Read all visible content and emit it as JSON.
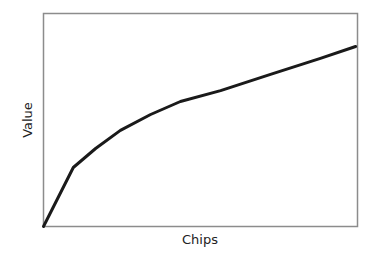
{
  "chart_data": {
    "type": "line",
    "title": "",
    "xlabel": "Chips",
    "ylabel": "Value",
    "x_ticks": [],
    "y_ticks": [],
    "grid": false,
    "legend": null,
    "xlim": [
      0,
      100
    ],
    "ylim": [
      0,
      100
    ],
    "series": [
      {
        "name": "Value",
        "color": "#1a1a1a",
        "x": [
          0,
          9.5,
          16.6,
          24.5,
          34.1,
          43.6,
          56.4,
          72.3,
          88.2,
          99.4
        ],
        "values": [
          0,
          27.7,
          36.6,
          45.1,
          52.6,
          58.7,
          63.8,
          71.4,
          78.9,
          84.5
        ]
      }
    ]
  },
  "axes": {
    "x_label": "Chips",
    "y_label": "Value",
    "frame_color": "#8c8c8c",
    "line_color": "#1a1a1a"
  }
}
